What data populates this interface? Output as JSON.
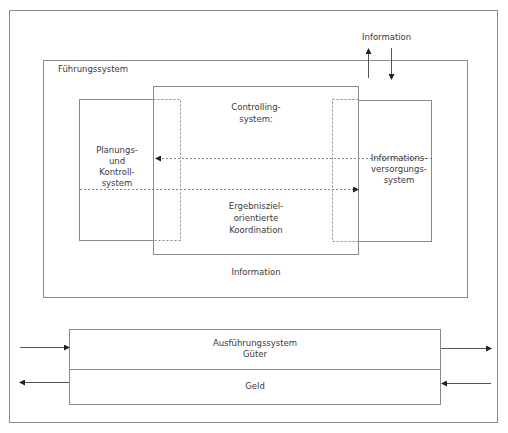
{
  "diagram": {
    "colors": {
      "line": "#7a7a7a",
      "frame": "#8a8a8a",
      "text": "#3a3a3a",
      "background": "#ffffff"
    },
    "top_label": "Information",
    "fuehrungssystem": {
      "label": "Führungssystem"
    },
    "planung": {
      "line1": "Planungs-",
      "line2": "und",
      "line3": "Kontroll-",
      "line4": "system"
    },
    "controlling": {
      "line1": "Controlling-",
      "line2": "system:",
      "coord1": "Ergebnisziel-",
      "coord2": "orientierte",
      "coord3": "Koordination"
    },
    "informationsversorgung": {
      "line1": "Informations-",
      "line2": "versorgungs-",
      "line3": "system"
    },
    "bottom_information": "Information",
    "ausfuehrung": {
      "line1": "Ausführungssystem",
      "line2": "Güter",
      "geld": "Geld"
    }
  }
}
